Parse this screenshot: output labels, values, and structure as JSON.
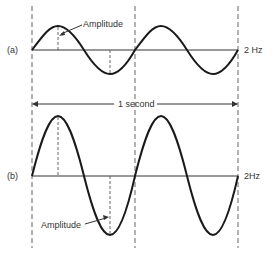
{
  "diagram": {
    "type": "sine-wave-comparison",
    "panels": [
      {
        "id": "a",
        "label": "(a)",
        "frequency_label": "2 Hz",
        "amplitude_label": "Amplitude",
        "cycles": 2,
        "amplitude": "small"
      },
      {
        "id": "b",
        "label": "(b)",
        "frequency_label": "2Hz",
        "amplitude_label": "Amplitude",
        "cycles": 2,
        "amplitude": "large"
      }
    ],
    "time_span_label": "1 second"
  },
  "colors": {
    "wave": "#1a1a1a",
    "axis": "#333333",
    "dash": "#666666",
    "text": "#333333"
  }
}
